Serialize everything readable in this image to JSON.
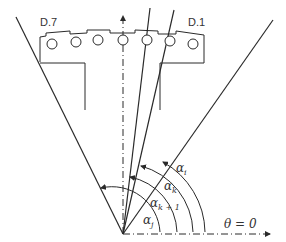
{
  "diagram": {
    "slot_labels": {
      "left": "D.7",
      "right": "D.1"
    },
    "angle_labels": [
      {
        "symbol": "α",
        "subscript": "i"
      },
      {
        "symbol": "α",
        "subscript": "k"
      },
      {
        "symbol": "α",
        "subscript": "k + 1"
      },
      {
        "symbol": "α",
        "subscript": "j"
      }
    ],
    "reference_label": "θ = 0",
    "slot_count": 7,
    "colors": {
      "line": "#2a2a2a",
      "background": "#ffffff"
    }
  }
}
